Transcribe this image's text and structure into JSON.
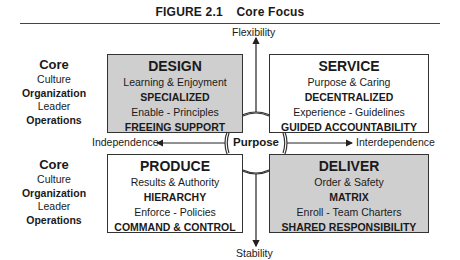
{
  "figure": {
    "number": "FIGURE 2.1",
    "title": "Core Focus"
  },
  "axes": {
    "top": "Flexibility",
    "bottom": "Stability",
    "left": "Independence",
    "right": "Interdependence",
    "center": "Purpose"
  },
  "side_legend": {
    "top": [
      "Core",
      "Culture",
      "Organization",
      "Leader",
      "Operations"
    ],
    "bottom": [
      "Core",
      "Culture",
      "Organization",
      "Leader",
      "Operations"
    ]
  },
  "quadrants": {
    "design": {
      "title": "DESIGN",
      "culture": "Learning & Enjoyment",
      "organization": "SPECIALIZED",
      "leader": "Enable - Principles",
      "operations": "FREEING SUPPORT",
      "fill": "#cfcfcf"
    },
    "service": {
      "title": "SERVICE",
      "culture": "Purpose & Caring",
      "organization": "DECENTRALIZED",
      "leader": "Experience - Guidelines",
      "operations": "GUIDED ACCOUNTABILITY",
      "fill": "#ffffff"
    },
    "produce": {
      "title": "PRODUCE",
      "culture": "Results & Authority",
      "organization": "HIERARCHY",
      "leader": "Enforce - Policies",
      "operations": "COMMAND & CONTROL",
      "fill": "#ffffff"
    },
    "deliver": {
      "title": "DELIVER",
      "culture": "Order & Safety",
      "organization": "MATRIX",
      "leader": "Enroll - Team Charters",
      "operations": "SHARED RESPONSIBILITY",
      "fill": "#cfcfcf"
    }
  }
}
